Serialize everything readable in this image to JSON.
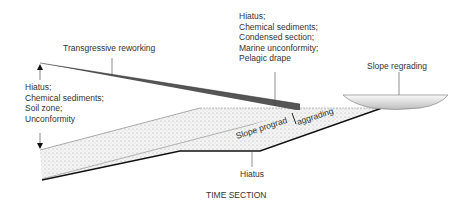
{
  "diagram": {
    "title": "TIME SECTION",
    "labels": {
      "transgressive": "Transgressive reworking",
      "left_hiatus": [
        "Hiatus;",
        "Chemical sediments;",
        "Soil zone;",
        "Unconformity"
      ],
      "top_hiatus": [
        "Hiatus;",
        "Chemical sediments;",
        "Condensed section;",
        "Marine unconformity;",
        "Pelagic drape"
      ],
      "slope_regrading": "Slope regrading",
      "slope_prograd": "Slope prograd",
      "aggrading": "aggrading",
      "bottom_hiatus": "Hiatus"
    },
    "colors": {
      "wedge": "#555555",
      "line": "#222222",
      "fill": "#eeeeee"
    }
  }
}
